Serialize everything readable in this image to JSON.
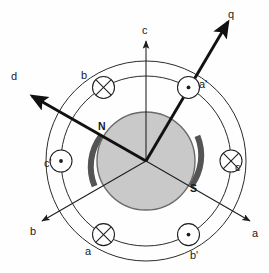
{
  "figure": {
    "type": "machine-cross-section",
    "colors": {
      "rotor_fill": "#c9c9c9",
      "rotor_stroke": "#555555",
      "pole_arc": "#545454",
      "circle_stroke": "#2b2b2b",
      "thin_axis": "#1d1d1d",
      "thick_axis": "#111111",
      "background": "#fefefe",
      "text": "#1a1a1a"
    },
    "geometry": {
      "center_x": 146,
      "center_y": 161,
      "stator_outer_radius": 100,
      "winding_ring_radius": 85,
      "rotor_radius": 49,
      "winding_circle_radius": 11
    }
  },
  "axes": [
    {
      "id": "d",
      "label": "d",
      "style": "thick",
      "angle_deg": 151,
      "arrow": true,
      "label_x": 11,
      "label_y": 71
    },
    {
      "id": "q",
      "label": "q",
      "style": "thick",
      "angle_deg": 61,
      "arrow": true,
      "label_x": 228,
      "label_y": 9
    },
    {
      "id": "c",
      "label": "c",
      "style": "thin",
      "angle_deg": 90,
      "arrow": true,
      "label_x": 142,
      "label_y": 25
    },
    {
      "id": "a",
      "label": "a",
      "style": "thin",
      "angle_deg": -30,
      "arrow": true,
      "label_x": 252,
      "label_y": 228
    },
    {
      "id": "b",
      "label": "b",
      "style": "thin",
      "angle_deg": 210,
      "arrow": true,
      "label_x": 30,
      "label_y": 226
    }
  ],
  "windings": [
    {
      "id": "b",
      "label": "b",
      "marker": "cross-circle",
      "angle_deg": 120,
      "label_x": 81,
      "label_y": 70
    },
    {
      "id": "a-prime",
      "label": "a'",
      "marker": "dot-circle",
      "angle_deg": 60,
      "label_x": 199,
      "label_y": 79
    },
    {
      "id": "c-prime",
      "label": "c'",
      "marker": "dot-circle",
      "angle_deg": 180,
      "label_x": 44,
      "label_y": 158
    },
    {
      "id": "c",
      "label": "c",
      "marker": "cross-circle",
      "angle_deg": 0,
      "label_x": 235,
      "label_y": 162
    },
    {
      "id": "a",
      "label": "a",
      "marker": "cross-circle",
      "angle_deg": 240,
      "label_x": 85,
      "label_y": 246
    },
    {
      "id": "b-prime",
      "label": "b'",
      "marker": "dot-circle",
      "angle_deg": 300,
      "label_x": 190,
      "label_y": 250
    }
  ],
  "poles": [
    {
      "id": "north",
      "label": "N",
      "angle_deg": 151,
      "label_x": 98,
      "label_y": 121
    },
    {
      "id": "south",
      "label": "S",
      "angle_deg": -29,
      "label_x": 190,
      "label_y": 183
    }
  ]
}
